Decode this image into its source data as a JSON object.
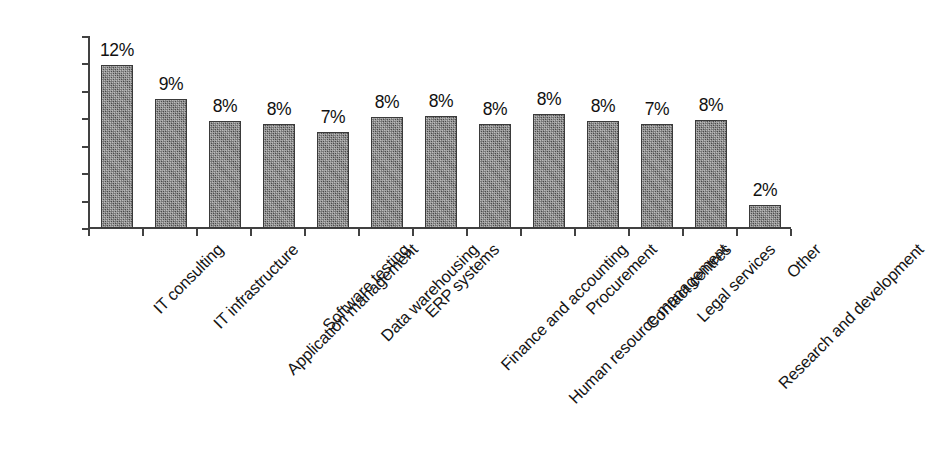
{
  "chart_data": {
    "type": "bar",
    "title": "",
    "subtitle": "",
    "xlabel": "",
    "ylabel": "",
    "ylim": [
      0,
      14
    ],
    "ytick_labels": [
      "0%",
      "2%",
      "4%",
      "6%",
      "8%",
      "10%",
      "12%",
      "14%"
    ],
    "ytick_values": [
      0,
      2,
      4,
      6,
      8,
      10,
      12,
      14
    ],
    "grid": false,
    "legend": false,
    "legend_position": "none",
    "value_suffix": "%",
    "categories": [
      "IT consulting",
      "IT infrastructure",
      "Application management",
      "Software testing",
      "Data warehousing",
      "ERP systems",
      "Finance and accounting",
      "Human resource management",
      "Procurement",
      "Contact centres",
      "Legal services",
      "Research and development",
      "Other"
    ],
    "values": [
      11.9,
      9.4,
      7.8,
      7.6,
      7.0,
      8.1,
      8.2,
      7.6,
      8.3,
      7.8,
      7.6,
      7.9,
      1.7
    ],
    "data_labels": [
      "12%",
      "9%",
      "8%",
      "8%",
      "7%",
      "8%",
      "8%",
      "8%",
      "8%",
      "8%",
      "7%",
      "8%",
      "2%"
    ],
    "bar_color": "#757575",
    "bar_fill": "dithered-gray-checkerboard",
    "bar_border_color": "#3a3a3a",
    "axis_color": "#414141",
    "text_color": "#111111",
    "background_color": "#ffffff"
  }
}
